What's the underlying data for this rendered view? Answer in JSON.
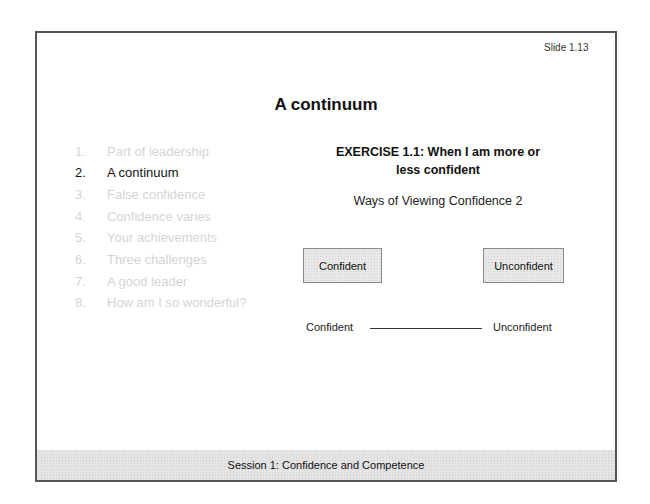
{
  "slide": {
    "number_label": "Slide 1.13",
    "title": "A continuum"
  },
  "agenda": {
    "items": [
      {
        "num": "1.",
        "label": "Part of leadership",
        "active": false
      },
      {
        "num": "2.",
        "label": "A continuum",
        "active": true
      },
      {
        "num": "3.",
        "label": "False confidence",
        "active": false
      },
      {
        "num": "4.",
        "label": "Confidence varies",
        "active": false
      },
      {
        "num": "5.",
        "label": "Your achievements",
        "active": false
      },
      {
        "num": "6.",
        "label": "Three challenges",
        "active": false
      },
      {
        "num": "7.",
        "label": "A good leader",
        "active": false
      },
      {
        "num": "8.",
        "label": "How am I so wonderful?",
        "active": false
      }
    ]
  },
  "exercise": {
    "title_line1": "EXERCISE 1.1: When I am more or",
    "title_line2": "less confident",
    "subtitle": "Ways of Viewing Confidence 2",
    "box_left": "Confident",
    "box_right": "Unconfident",
    "scale_left": "Confident",
    "scale_right": "Unconfident"
  },
  "footer": {
    "text": "Session 1: Confidence and Competence"
  },
  "colors": {
    "border": "#555555",
    "inactive_text": "#d4d4d4",
    "active_text": "#111111",
    "box_fill": "#e8e8e8",
    "footer_fill": "#e4e4e4"
  }
}
